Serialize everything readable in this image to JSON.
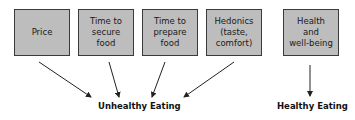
{
  "diagram": {
    "factors": [
      {
        "id": "price",
        "label": "Price"
      },
      {
        "id": "time-secure",
        "label": "Time to\nsecure\nfood"
      },
      {
        "id": "time-prepare",
        "label": "Time to\nprepare\nfood"
      },
      {
        "id": "hedonics",
        "label": "Hedonics\n(taste,\ncomfort)"
      },
      {
        "id": "health",
        "label": "Health\nand\nwell-being"
      }
    ],
    "outcomes": {
      "unhealthy": "Unhealthy Eating",
      "healthy": "Healthy Eating"
    },
    "edges": [
      {
        "from": "price",
        "to": "unhealthy"
      },
      {
        "from": "time-secure",
        "to": "unhealthy"
      },
      {
        "from": "time-prepare",
        "to": "unhealthy"
      },
      {
        "from": "hedonics",
        "to": "unhealthy"
      },
      {
        "from": "health",
        "to": "healthy"
      }
    ],
    "colors": {
      "box_fill": "#bdbdbd",
      "box_border": "#3a3a3a",
      "arrow": "#222222"
    }
  }
}
